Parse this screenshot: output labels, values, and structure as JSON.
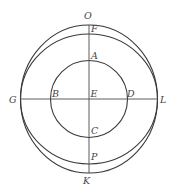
{
  "figure": {
    "type": "geometry-diagram",
    "colors": {
      "stroke": "#3a3a3a",
      "label": "#444444",
      "background": "#ffffff"
    },
    "center": {
      "x": 89,
      "y": 99
    },
    "curves": [
      {
        "id": "outer-circle",
        "points": "O G K L",
        "rx": 68.5,
        "ry": 74
      },
      {
        "id": "inner-oval",
        "points": "F G P L",
        "rx": 68.5,
        "ry": 65
      },
      {
        "id": "inner-circle",
        "points": "A B C D",
        "r": 38.5
      }
    ],
    "labels": {
      "O": "O",
      "F": "F",
      "A": "A",
      "G": "G",
      "B": "B",
      "E": "E",
      "D": "D",
      "L": "L",
      "C": "C",
      "P": "P",
      "K": "K"
    }
  }
}
